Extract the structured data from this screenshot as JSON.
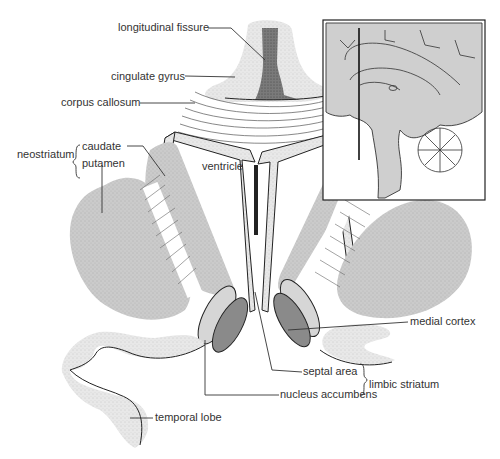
{
  "labels": {
    "longitudinal_fissure": "longitudinal fissure",
    "cingulate_gyrus": "cingulate gyrus",
    "corpus_callosum": "corpus callosum",
    "neostriatum": "neostriatum",
    "caudate": "caudate",
    "putamen": "putamen",
    "ventricle": "ventricle",
    "medial_cortex": "medial cortex",
    "septal_area": "septal area",
    "nucleus_accumbens": "nucleus accumbens",
    "limbic_striatum": "limbic striatum",
    "temporal_lobe": "temporal lobe"
  },
  "groups": {
    "neostriatum": [
      "caudate",
      "putamen"
    ],
    "limbic_striatum": [
      "septal area",
      "nucleus accumbens"
    ]
  },
  "inset": {
    "description": "Sagittal view of the brain with a vertical line indicating the plane of section"
  },
  "colors": {
    "striatum_fill": "#c9c9c9",
    "light_nucleus": "#d6d6d6",
    "dark_nucleus": "#8a8a8a",
    "inset_fill": "#cfcfcf",
    "fissure_fill": "#6b6b6b",
    "line": "#333333"
  }
}
